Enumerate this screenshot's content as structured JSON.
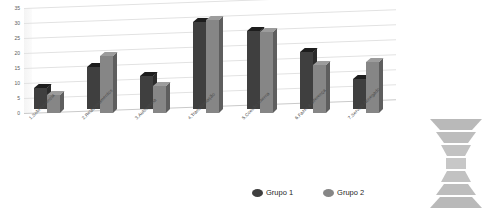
{
  "chart_data": {
    "type": "bar",
    "title": "",
    "subtitle": "",
    "xlabel": "",
    "ylabel": "",
    "ylim": [
      0,
      35
    ],
    "yticks": [
      0,
      5,
      10,
      15,
      20,
      25,
      30,
      35
    ],
    "grid": true,
    "legend_position": "bottom",
    "categories": [
      "1.Sobrevivência",
      "2.Relacionamentos",
      "3.Autoestima",
      "4.Transformação",
      "5.Coesão Interna",
      "6.Fazer a diferença",
      "7.Serviço Abnegado"
    ],
    "series": [
      {
        "name": "Grupo 1",
        "color": "#3f3f3f",
        "values": [
          7,
          14,
          11,
          29,
          26,
          19,
          10
        ]
      },
      {
        "name": "Grupo 2",
        "color": "#868686",
        "values": [
          6,
          19,
          9,
          31,
          27,
          16,
          17
        ]
      }
    ]
  },
  "legend": {
    "items": [
      {
        "label": "Grupo 1",
        "color": "#3f3f3f"
      },
      {
        "label": "Grupo 2",
        "color": "#868686"
      }
    ]
  },
  "funnel": {
    "segments": [
      {
        "number": "7"
      },
      {
        "number": "6"
      },
      {
        "number": "5"
      },
      {
        "number": "4"
      },
      {
        "number": "3"
      },
      {
        "number": "2"
      },
      {
        "number": "1"
      }
    ]
  }
}
